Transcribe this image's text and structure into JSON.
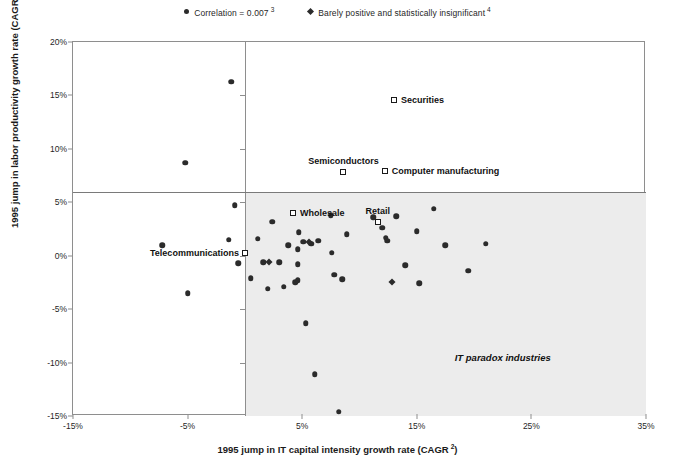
{
  "legend": {
    "items": [
      {
        "marker": "circle",
        "label": "Correlation = 0.007",
        "sup": "3"
      },
      {
        "marker": "diamond",
        "label": "Barely positive and statistically insignificant",
        "sup": "4"
      }
    ]
  },
  "annotations": {
    "paradox": "IT paradox industries"
  },
  "chart_data": {
    "type": "scatter",
    "title": "",
    "xlabel": "1995 jump in IT capital intensity growth rate (CAGR",
    "xlabel_sup": "2",
    "xlabel_tail": ")",
    "ylabel": "1995 jump in labor productivity growth rate (CAGR",
    "ylabel_sup": "1",
    "ylabel_tail": ")",
    "xlim": [
      -15,
      35
    ],
    "ylim": [
      -15,
      20
    ],
    "xticks": [
      "-15%",
      "-5%",
      "5%",
      "15%",
      "25%",
      "35%"
    ],
    "xtick_values": [
      -15,
      -5,
      5,
      15,
      25,
      35
    ],
    "yticks": [
      "20%",
      "15%",
      "10%",
      "5%",
      "0%",
      "-5%",
      "-10%",
      "-15%"
    ],
    "ytick_values": [
      20,
      15,
      10,
      5,
      0,
      -5,
      -10,
      -15
    ],
    "grid": false,
    "legend_position": "top-center",
    "series": [
      {
        "name": "Correlation = 0.007",
        "marker": "circle",
        "points": [
          {
            "x": -7.2,
            "y": 1.0
          },
          {
            "x": -5.2,
            "y": 8.7
          },
          {
            "x": -5.0,
            "y": -3.5
          },
          {
            "x": -1.4,
            "y": 1.5
          },
          {
            "x": -0.6,
            "y": -0.7
          },
          {
            "x": -1.2,
            "y": 16.3
          },
          {
            "x": -0.9,
            "y": 4.7
          },
          {
            "x": 0.5,
            "y": -2.1
          },
          {
            "x": 1.1,
            "y": 1.6
          },
          {
            "x": 1.6,
            "y": -0.6
          },
          {
            "x": 2.0,
            "y": -3.1
          },
          {
            "x": 2.4,
            "y": 3.2
          },
          {
            "x": 3.0,
            "y": -0.6
          },
          {
            "x": 3.4,
            "y": -2.9
          },
          {
            "x": 3.8,
            "y": 1.0
          },
          {
            "x": 4.4,
            "y": -2.5
          },
          {
            "x": 4.6,
            "y": -2.3
          },
          {
            "x": 4.7,
            "y": 2.2
          },
          {
            "x": 4.6,
            "y": 0.6
          },
          {
            "x": 4.6,
            "y": -0.8
          },
          {
            "x": 5.1,
            "y": 1.3
          },
          {
            "x": 5.8,
            "y": 1.1
          },
          {
            "x": 5.3,
            "y": -6.3
          },
          {
            "x": 6.1,
            "y": -11.1
          },
          {
            "x": 6.4,
            "y": 1.4
          },
          {
            "x": 7.6,
            "y": 0.3
          },
          {
            "x": 7.8,
            "y": -1.8
          },
          {
            "x": 7.5,
            "y": 3.8
          },
          {
            "x": 8.5,
            "y": -2.2
          },
          {
            "x": 8.2,
            "y": -14.6
          },
          {
            "x": 8.9,
            "y": 2.0
          },
          {
            "x": 11.2,
            "y": 3.6
          },
          {
            "x": 12.0,
            "y": 2.6
          },
          {
            "x": 12.3,
            "y": 1.7
          },
          {
            "x": 12.4,
            "y": 1.4
          },
          {
            "x": 13.2,
            "y": 3.7
          },
          {
            "x": 14.0,
            "y": -0.9
          },
          {
            "x": 15.2,
            "y": -2.6
          },
          {
            "x": 15.0,
            "y": 2.3
          },
          {
            "x": 16.5,
            "y": 4.4
          },
          {
            "x": 17.5,
            "y": 1.0
          },
          {
            "x": 19.5,
            "y": -1.4
          },
          {
            "x": 21.0,
            "y": 1.1
          }
        ]
      },
      {
        "name": "Barely positive and statistically insignificant",
        "marker": "diamond",
        "points": [
          {
            "x": 2.1,
            "y": -0.6
          },
          {
            "x": 5.6,
            "y": 1.3
          },
          {
            "x": 12.8,
            "y": -2.5
          }
        ]
      },
      {
        "name": "Labeled industries",
        "marker": "square",
        "points": [
          {
            "x": 13.0,
            "y": 14.6,
            "label": "Securities",
            "label_pos": "right"
          },
          {
            "x": 8.6,
            "y": 7.8,
            "label": "Semiconductors",
            "label_pos": "above"
          },
          {
            "x": 12.2,
            "y": 7.9,
            "label": "Computer manufacturing",
            "label_pos": "right"
          },
          {
            "x": 4.2,
            "y": 4.0,
            "label": "Wholesale",
            "label_pos": "right"
          },
          {
            "x": 11.6,
            "y": 3.2,
            "label": "Retail",
            "label_pos": "above"
          },
          {
            "x": 0.0,
            "y": 0.3,
            "label": "Telecommunications",
            "label_pos": "left"
          }
        ]
      }
    ]
  }
}
